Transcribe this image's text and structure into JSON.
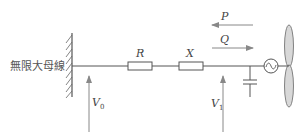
{
  "diagram": {
    "busbar_label": "無限大母線",
    "resistor_label": "R",
    "reactance_label": "X",
    "active_power_label": "P",
    "reactive_power_label": "Q",
    "voltage_source_label": "V",
    "voltage_source_sub": "0",
    "voltage_terminal_label": "V",
    "voltage_terminal_sub": "1",
    "colors": {
      "line": "#555555",
      "arrow": "#888888",
      "blade_fill": "#d8d8d8"
    }
  }
}
